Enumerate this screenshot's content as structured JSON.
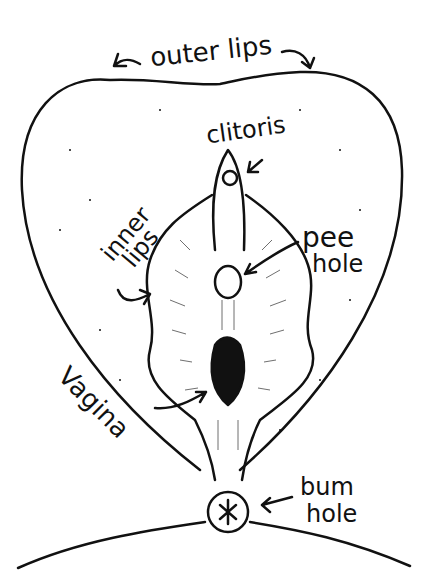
{
  "diagram": {
    "type": "anatomical-line-drawing",
    "style": "hand-drawn black ink on white",
    "colors": {
      "ink": "#111111",
      "background": "#ffffff"
    },
    "labels": {
      "outer_lips": "outer lips",
      "clitoris": "clitoris",
      "inner_lips_line1": "inner",
      "inner_lips_line2": "lips",
      "pee_hole_line1": "pee",
      "pee_hole_line2": "hole",
      "vagina": "Vagina",
      "bum_hole_line1": "bum",
      "bum_hole_line2": "hole"
    }
  }
}
